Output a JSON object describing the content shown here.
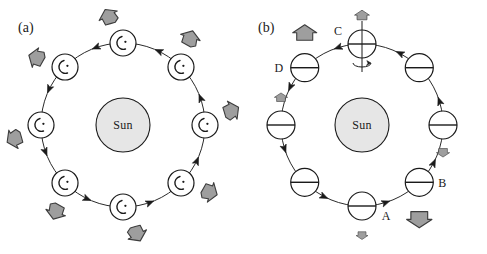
{
  "figure": {
    "type": "diagram",
    "background_color": "#ffffff",
    "width": 487,
    "height": 254
  },
  "style": {
    "stroke": "#1a1a1a",
    "arrow_fill": "#9e9e9e",
    "arrow_stroke": "#3c3c3c",
    "sun_fill": "#e6e6e6",
    "planet_fill": "#ffffff",
    "orbit_stroke": "#2b2b2b"
  },
  "panels": [
    {
      "id": "a",
      "label": "(a)",
      "label_pos": {
        "x": 18,
        "y": 32
      },
      "center": {
        "x": 123,
        "y": 125
      },
      "orbit_radius": 82,
      "sun": {
        "label": "Sun",
        "radius": 27,
        "name": "sun-body-a"
      },
      "planet_radius": 13,
      "planet_marking": "crescent-and-dot",
      "planet_count": 8,
      "arrow_style": "irregular-pentagon",
      "planets": [
        {
          "index": 0,
          "angle_deg": 90,
          "arrow_angle_deg": 118,
          "arrow_scale": 1.0
        },
        {
          "index": 1,
          "angle_deg": 45,
          "arrow_angle_deg": 72,
          "arrow_scale": 1.0
        },
        {
          "index": 2,
          "angle_deg": 0,
          "arrow_angle_deg": 28,
          "arrow_scale": 1.0
        },
        {
          "index": 3,
          "angle_deg": 315,
          "arrow_angle_deg": 342,
          "arrow_scale": 1.0
        },
        {
          "index": 4,
          "angle_deg": 270,
          "arrow_angle_deg": 297,
          "arrow_scale": 1.0
        },
        {
          "index": 5,
          "angle_deg": 225,
          "arrow_angle_deg": 252,
          "arrow_scale": 1.0
        },
        {
          "index": 6,
          "angle_deg": 180,
          "arrow_angle_deg": 207,
          "arrow_scale": 1.0
        },
        {
          "index": 7,
          "angle_deg": 135,
          "arrow_angle_deg": 162,
          "arrow_scale": 1.0
        }
      ],
      "orbit_direction": "counterclockwise",
      "orbit_arrow_angles_deg": [
        112,
        67,
        22,
        337,
        292,
        247,
        202,
        157
      ]
    },
    {
      "id": "b",
      "label": "(b)",
      "label_pos": {
        "x": 258,
        "y": 32
      },
      "center": {
        "x": 362,
        "y": 125
      },
      "orbit_radius": 81,
      "sun": {
        "label": "Sun",
        "radius": 27,
        "name": "sun-body-b"
      },
      "planet_radius": 14,
      "planet_marking": "equator-line",
      "planet_count": 8,
      "arrow_style": "block-arrow",
      "spin_axis_planet_index": 0,
      "spin_axis_note": "rotation arrow about vertical axis",
      "planets": [
        {
          "index": 0,
          "angle_deg": 90,
          "letter": "C",
          "letter_dx": -24,
          "letter_dy": -9,
          "arrow_dir": "up",
          "arrow_scale": 0.62,
          "arrow_dist": 27
        },
        {
          "index": 1,
          "angle_deg": 45,
          "letter": null,
          "arrow_dir": null,
          "arrow_scale": 0,
          "arrow_dist": 0
        },
        {
          "index": 2,
          "angle_deg": 0,
          "letter": null,
          "arrow_dir": "down",
          "arrow_scale": 0.55,
          "arrow_dist": 26
        },
        {
          "index": 3,
          "angle_deg": 315,
          "letter": "B",
          "letter_dx": 23,
          "letter_dy": 5,
          "arrow_dir": "down",
          "arrow_scale": 1.05,
          "arrow_dist": 34
        },
        {
          "index": 4,
          "angle_deg": 270,
          "letter": "A",
          "letter_dx": 24,
          "letter_dy": 14,
          "arrow_dir": "down",
          "arrow_scale": 0.5,
          "arrow_dist": 28
        },
        {
          "index": 5,
          "angle_deg": 225,
          "letter": null,
          "arrow_dir": null,
          "arrow_scale": 0,
          "arrow_dist": 0
        },
        {
          "index": 6,
          "angle_deg": 180,
          "letter": null,
          "arrow_dir": "up",
          "arrow_scale": 0.55,
          "arrow_dist": 26
        },
        {
          "index": 7,
          "angle_deg": 135,
          "letter": "D",
          "letter_dx": -26,
          "letter_dy": 4,
          "arrow_dir": "up",
          "arrow_scale": 1.0,
          "arrow_dist": 32
        }
      ],
      "orbit_direction": "counterclockwise",
      "orbit_arrow_angles_deg": [
        110,
        65,
        20,
        335,
        290,
        245,
        200,
        155
      ],
      "letters": [
        "A",
        "B",
        "C",
        "D"
      ]
    }
  ]
}
